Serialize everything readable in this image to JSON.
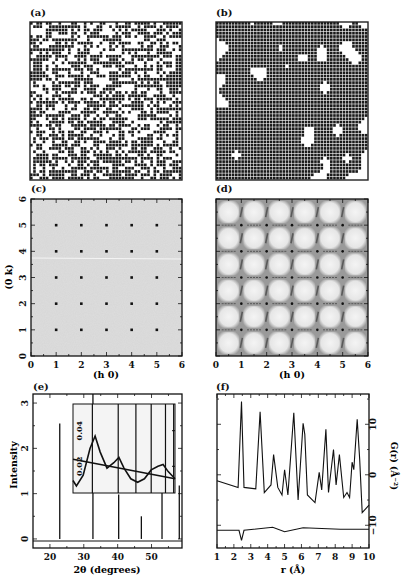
{
  "panels": {
    "a": {
      "label": "(a)"
    },
    "b": {
      "label": "(b)"
    },
    "c": {
      "label": "(c)"
    },
    "d": {
      "label": "(d)"
    },
    "e": {
      "label": "(e)"
    },
    "f": {
      "label": "(f)"
    }
  },
  "colors": {
    "ink": "#111111",
    "diffuse_bg_c": "#d4d4d4",
    "diffuse_bg_d": "#efefef"
  },
  "chart_data": [
    {
      "panel": "(a)",
      "type": "heatmap",
      "title": "",
      "description": "Random binary occupancy lattice (disordered configuration)",
      "grid": [
        48,
        48
      ]
    },
    {
      "panel": "(b)",
      "type": "heatmap",
      "title": "",
      "description": "Binary occupancy lattice with short-range ordered clusters",
      "grid": [
        48,
        48
      ]
    },
    {
      "panel": "(c)",
      "type": "scatter",
      "title": "",
      "xlabel": "(h 0)",
      "ylabel": "(0 k)",
      "xlim": [
        0,
        6
      ],
      "ylim": [
        0,
        6
      ],
      "xticks": [
        "0",
        "1",
        "2",
        "3",
        "4",
        "5",
        "6"
      ],
      "yticks": [
        "0",
        "1",
        "2",
        "3",
        "4",
        "5",
        "6"
      ],
      "points": [
        [
          1,
          1
        ],
        [
          2,
          1
        ],
        [
          3,
          1
        ],
        [
          4,
          1
        ],
        [
          5,
          1
        ],
        [
          1,
          2
        ],
        [
          2,
          2
        ],
        [
          3,
          2
        ],
        [
          4,
          2
        ],
        [
          5,
          2
        ],
        [
          1,
          3
        ],
        [
          2,
          3
        ],
        [
          3,
          3
        ],
        [
          4,
          3
        ],
        [
          5,
          3
        ],
        [
          1,
          4
        ],
        [
          2,
          4
        ],
        [
          3,
          4
        ],
        [
          4,
          4
        ],
        [
          5,
          4
        ],
        [
          1,
          5
        ],
        [
          2,
          5
        ],
        [
          3,
          5
        ],
        [
          4,
          5
        ],
        [
          5,
          5
        ]
      ],
      "background": "uniform grey diffuse scattering"
    },
    {
      "panel": "(d)",
      "type": "heatmap",
      "title": "",
      "xlabel": "(h 0)",
      "ylabel": "",
      "xlim": [
        0,
        6
      ],
      "ylim": [
        0,
        6
      ],
      "xticks": [
        "0",
        "1",
        "2",
        "3",
        "4",
        "5",
        "6"
      ],
      "description": "Structured diffuse scattering: bright squares between Bragg positions with dark streaks along integer lines"
    },
    {
      "panel": "(e)",
      "type": "bar",
      "title": "",
      "xlabel": "2θ (degrees)",
      "ylabel": "Intensity",
      "xlim": [
        15,
        59
      ],
      "ylim": [
        -0.2,
        3.2
      ],
      "xticks": [
        "20",
        "30",
        "40",
        "50"
      ],
      "yticks": [
        "0",
        "1",
        "2",
        "3"
      ],
      "x": [
        22.9,
        32.7,
        40.3,
        47.0,
        53.1,
        58.2
      ],
      "values": [
        2.55,
        3.2,
        0.98,
        0.5,
        1.45,
        1.18
      ],
      "inset": {
        "type": "line",
        "xlim": [
          27,
          57
        ],
        "ylim": [
          0.005,
          0.055
        ],
        "yticks": [
          "0.02",
          "0.04"
        ],
        "series": [
          {
            "name": "diffuse (structured)",
            "x": [
              27,
              28,
              30,
              32,
              33.5,
              35,
              37,
              39,
              40.5,
              42,
              44,
              46,
              48,
              50,
              52,
              53.5,
              55,
              57
            ],
            "values": [
              0.012,
              0.009,
              0.015,
              0.03,
              0.037,
              0.028,
              0.019,
              0.022,
              0.025,
              0.019,
              0.013,
              0.011,
              0.013,
              0.018,
              0.02,
              0.021,
              0.017,
              0.013
            ]
          },
          {
            "name": "diffuse (random)",
            "x": [
              27,
              57
            ],
            "values": [
              0.024,
              0.013
            ]
          }
        ],
        "bragg_lines_x": [
          32.7,
          40.3,
          45.5,
          50.0,
          54.2,
          56.6
        ]
      }
    },
    {
      "panel": "(f)",
      "type": "line",
      "title": "",
      "xlabel": "r (Å)",
      "ylabel": "G(r) (Å⁻²)",
      "xlim": [
        1,
        10
      ],
      "ylim": [
        -14.5,
        16
      ],
      "xticks": [
        "1",
        "2",
        "3",
        "4",
        "5",
        "6",
        "7",
        "8",
        "9",
        "10"
      ],
      "yticks": [
        "-10",
        "0",
        "10"
      ],
      "series": [
        {
          "name": "G(r)",
          "x": [
            1.0,
            2.25,
            2.45,
            2.6,
            3.3,
            3.55,
            3.8,
            4.2,
            4.35,
            4.6,
            4.85,
            5.0,
            5.2,
            5.55,
            5.8,
            6.1,
            6.2,
            6.35,
            6.8,
            7.05,
            7.2,
            7.45,
            7.6,
            7.9,
            8.05,
            8.25,
            8.5,
            8.7,
            8.85,
            9.0,
            9.1,
            9.3,
            9.45,
            9.6,
            10.0
          ],
          "values": [
            -1.2,
            -2.5,
            14.5,
            -2.5,
            -2.8,
            12.5,
            -3.5,
            -2.0,
            4.0,
            -2.5,
            -4.0,
            1.0,
            -4.0,
            12.3,
            -5.0,
            10.2,
            8.0,
            -4.0,
            -5.5,
            0.5,
            -3.0,
            9.0,
            -3.5,
            5.0,
            -2.0,
            4.0,
            -4.5,
            -3.5,
            -4.5,
            2.5,
            1.0,
            11.0,
            3.0,
            -7.5,
            -6.0
          ]
        },
        {
          "name": "difference",
          "offset": -11,
          "x": [
            1.0,
            2.3,
            2.45,
            2.6,
            4.3,
            5.0,
            6.1,
            8.3,
            10.0
          ],
          "values": [
            -11.0,
            -11.0,
            -13.0,
            -11.0,
            -10.4,
            -11.3,
            -10.5,
            -10.8,
            -10.8
          ]
        }
      ]
    }
  ],
  "axes_text": {
    "c_xlabel": "(h 0)",
    "c_ylabel": "(0 k)",
    "d_xlabel": "(h 0)",
    "e_xlabel": "2θ (degrees)",
    "e_ylabel": "Intensity",
    "f_xlabel": "r (Å)",
    "f_ylabel": "G(r) (Å⁻²)"
  }
}
